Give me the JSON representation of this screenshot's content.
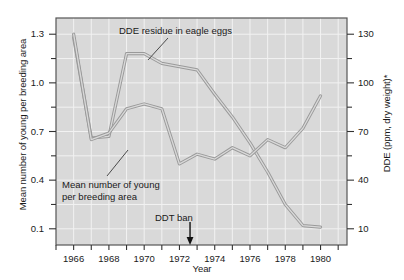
{
  "chart_data": {
    "type": "line",
    "title": "",
    "xlabel": "Year",
    "ylabel_left": "Mean number of young per breeding area",
    "ylabel_right": "DDE (ppm, dry weight)*",
    "xlim": [
      1965.0,
      1981.5
    ],
    "ylim_left": [
      0.0,
      1.4
    ],
    "ylim_right": [
      0,
      140
    ],
    "grid": true,
    "legend_position": "none",
    "background": "#d9d9d9",
    "line_color": "#9a9a9a",
    "xticks_major": [
      1966,
      1968,
      1970,
      1972,
      1974,
      1976,
      1978,
      1980
    ],
    "xticks_major_labels": [
      "1966",
      "1968",
      "1970",
      "1972",
      "1974",
      "1976",
      "1978",
      "1980"
    ],
    "xticks_minor": [
      1965,
      1967,
      1969,
      1971,
      1973,
      1975,
      1977,
      1979,
      1981
    ],
    "yticks_left_major": [
      1.3,
      1.0,
      0.7,
      0.4,
      0.1
    ],
    "yticks_left_major_labels": [
      "1.3",
      "1.0",
      "0.7",
      "0.4",
      "0.1"
    ],
    "yticks_left_minor": [
      1.15,
      0.85,
      0.55,
      0.25
    ],
    "yticks_right_major": [
      130,
      100,
      70,
      40,
      10
    ],
    "yticks_right_major_labels": [
      "130",
      "100",
      "70",
      "40",
      "10"
    ],
    "yticks_right_minor": [
      115,
      85,
      55,
      25
    ],
    "series": [
      {
        "name": "DDE residue in eagle eggs",
        "axis": "right",
        "x": [
          1966,
          1967,
          1968,
          1969,
          1970,
          1971,
          1972,
          1973,
          1974,
          1975,
          1976,
          1977,
          1978,
          1979,
          1980
        ],
        "values": [
          128,
          66,
          67,
          118,
          118,
          112,
          110,
          108,
          93,
          79,
          63,
          45,
          25,
          12,
          11
        ]
      },
      {
        "name": "Mean number of young per breeding area",
        "axis": "left",
        "x": [
          1966,
          1967,
          1968,
          1969,
          1970,
          1971,
          1972,
          1973,
          1974,
          1975,
          1976,
          1977,
          1978,
          1979,
          1980
        ],
        "values": [
          1.3,
          0.65,
          0.69,
          0.84,
          0.87,
          0.84,
          0.5,
          0.56,
          0.53,
          0.6,
          0.55,
          0.65,
          0.6,
          0.72,
          0.92
        ]
      }
    ],
    "annotations": [
      {
        "id": "dde-label",
        "text": "DDE residue in eagle eggs",
        "leader": true
      },
      {
        "id": "young-label",
        "line1": "Mean number of young",
        "line2": "per breeding area",
        "leader": true
      },
      {
        "id": "ddt-ban",
        "text": "DDT ban",
        "arrow_year": 1972.6,
        "arrow": true
      }
    ]
  },
  "axes": {
    "x_title": "Year",
    "y_left_title": "Mean number of young per breeding area",
    "y_right_title": "DDE (ppm, dry weight)*"
  }
}
